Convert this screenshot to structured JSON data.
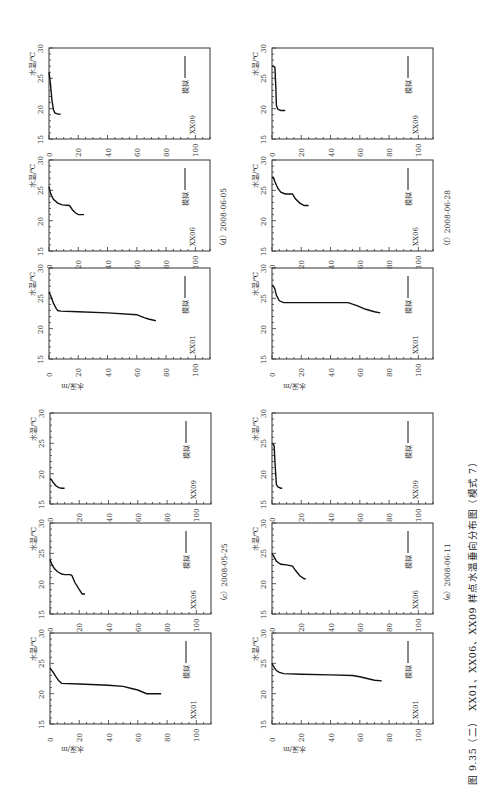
{
  "figure": {
    "caption": "图 9.35（二）　XX01、XX06、XX09 样点水温垂向分布图（模式 7）",
    "orientation": "rotated 90° (landscape figure on portrait page)"
  },
  "labels": {
    "temp_axis": "水温/℃",
    "depth_axis": "水深/m",
    "legend": "模拟 ——"
  },
  "groups": [
    {
      "id": "d",
      "date_label": "（d）2008-06-05"
    },
    {
      "id": "f",
      "date_label": "（f）2008-06-28"
    },
    {
      "id": "c",
      "date_label": "（c）2008-05-25"
    },
    {
      "id": "e",
      "date_label": "（e）2008-06-11"
    }
  ],
  "chart_data": [
    {
      "type": "line",
      "group": "c",
      "date": "2008-05-25",
      "station": "XX01",
      "xlabel": "水深/m",
      "ylabel": "水温/℃",
      "xlim": [
        0,
        110
      ],
      "ylim": [
        15,
        30
      ],
      "xticks": [
        0,
        20,
        40,
        60,
        80,
        100
      ],
      "yticks": [
        15,
        20,
        25,
        30
      ],
      "legend": [
        "模拟"
      ],
      "series": [
        {
          "name": "模拟",
          "depth": [
            0,
            2,
            4,
            6,
            8,
            20,
            40,
            50,
            55,
            60,
            66,
            76
          ],
          "temp": [
            24.2,
            23.6,
            22.8,
            22.1,
            21.7,
            21.6,
            21.4,
            21.2,
            20.9,
            20.6,
            20.0,
            20.0
          ]
        }
      ]
    },
    {
      "type": "line",
      "group": "c",
      "date": "2008-05-25",
      "station": "XX06",
      "xlabel": "水深/m",
      "ylabel": "水温/℃",
      "xlim": [
        0,
        110
      ],
      "ylim": [
        15,
        30
      ],
      "xticks": [
        0,
        20,
        40,
        60,
        80,
        100
      ],
      "yticks": [
        15,
        20,
        25,
        30
      ],
      "legend": [
        "模拟"
      ],
      "series": [
        {
          "name": "模拟",
          "depth": [
            0,
            1,
            3,
            5,
            8,
            10,
            14,
            15,
            17,
            20,
            22,
            24
          ],
          "temp": [
            24.0,
            23.3,
            22.5,
            22.0,
            21.6,
            21.5,
            21.5,
            21.3,
            20.2,
            19.0,
            18.3,
            18.3
          ]
        }
      ]
    },
    {
      "type": "line",
      "group": "c",
      "date": "2008-05-25",
      "station": "XX09",
      "xlabel": "水深/m",
      "ylabel": "水温/℃",
      "xlim": [
        0,
        110
      ],
      "ylim": [
        15,
        30
      ],
      "xticks": [
        0,
        20,
        40,
        60,
        80,
        100
      ],
      "yticks": [
        15,
        20,
        25,
        30
      ],
      "legend": [
        "模拟"
      ],
      "series": [
        {
          "name": "模拟",
          "depth": [
            0,
            1,
            2,
            4,
            6,
            8,
            10
          ],
          "temp": [
            19.2,
            19.0,
            18.6,
            18.0,
            17.7,
            17.6,
            17.6
          ]
        }
      ]
    },
    {
      "type": "line",
      "group": "e",
      "date": "2008-06-11",
      "station": "XX01",
      "xlabel": "水深/m",
      "ylabel": "水温/℃",
      "xlim": [
        0,
        110
      ],
      "ylim": [
        15,
        30
      ],
      "xticks": [
        0,
        20,
        40,
        60,
        80,
        100
      ],
      "yticks": [
        15,
        20,
        25,
        30
      ],
      "legend": [
        "模拟"
      ],
      "series": [
        {
          "name": "模拟",
          "depth": [
            0,
            1,
            3,
            5,
            8,
            20,
            40,
            55,
            60,
            65,
            70,
            75
          ],
          "temp": [
            25.0,
            24.5,
            23.8,
            23.5,
            23.3,
            23.2,
            23.1,
            23.0,
            22.8,
            22.5,
            22.2,
            22.1
          ]
        }
      ]
    },
    {
      "type": "line",
      "group": "e",
      "date": "2008-06-11",
      "station": "XX06",
      "xlabel": "水深/m",
      "ylabel": "水温/℃",
      "xlim": [
        0,
        110
      ],
      "ylim": [
        15,
        30
      ],
      "xticks": [
        0,
        20,
        40,
        60,
        80,
        100
      ],
      "yticks": [
        15,
        20,
        25,
        30
      ],
      "legend": [
        "模拟"
      ],
      "series": [
        {
          "name": "模拟",
          "depth": [
            0,
            1,
            3,
            6,
            10,
            14,
            16,
            19,
            22,
            23
          ],
          "temp": [
            25.0,
            24.6,
            23.7,
            23.2,
            23.1,
            22.9,
            22.2,
            21.3,
            20.8,
            20.8
          ]
        }
      ]
    },
    {
      "type": "line",
      "group": "e",
      "date": "2008-06-11",
      "station": "XX09",
      "xlabel": "水深/m",
      "ylabel": "水温/℃",
      "xlim": [
        0,
        110
      ],
      "ylim": [
        15,
        30
      ],
      "xticks": [
        0,
        20,
        40,
        60,
        80,
        100
      ],
      "yticks": [
        15,
        20,
        25,
        30
      ],
      "legend": [
        "模拟"
      ],
      "series": [
        {
          "name": "模拟",
          "depth": [
            0,
            1,
            1.5,
            2,
            3,
            4,
            6,
            7
          ],
          "temp": [
            25.0,
            24.8,
            24.5,
            22.0,
            18.2,
            17.8,
            17.6,
            17.6
          ]
        }
      ]
    },
    {
      "type": "line",
      "group": "d",
      "date": "2008-06-05",
      "station": "XX01",
      "xlabel": "水深/m",
      "ylabel": "水温/℃",
      "xlim": [
        0,
        110
      ],
      "ylim": [
        15,
        30
      ],
      "xticks": [
        0,
        20,
        40,
        60,
        80,
        100
      ],
      "yticks": [
        15,
        20,
        25,
        30
      ],
      "legend": [
        "模拟"
      ],
      "series": [
        {
          "name": "模拟",
          "depth": [
            0,
            1,
            3,
            5,
            6,
            8,
            20,
            40,
            60,
            62,
            65,
            68,
            73
          ],
          "temp": [
            26.0,
            25.5,
            24.2,
            23.3,
            23.0,
            22.9,
            22.8,
            22.6,
            22.3,
            22.1,
            21.8,
            21.6,
            21.3
          ]
        }
      ]
    },
    {
      "type": "line",
      "group": "d",
      "date": "2008-06-05",
      "station": "XX06",
      "xlabel": "水深/m",
      "ylabel": "水温/℃",
      "xlim": [
        0,
        110
      ],
      "ylim": [
        15,
        30
      ],
      "xticks": [
        0,
        20,
        40,
        60,
        80,
        100
      ],
      "yticks": [
        15,
        20,
        25,
        30
      ],
      "legend": [
        "模拟"
      ],
      "series": [
        {
          "name": "模拟",
          "depth": [
            0,
            1,
            3,
            6,
            9,
            14,
            16,
            18,
            20,
            24
          ],
          "temp": [
            25.6,
            24.5,
            23.5,
            22.9,
            22.6,
            22.5,
            21.8,
            21.3,
            21.0,
            21.0
          ]
        }
      ]
    },
    {
      "type": "line",
      "group": "d",
      "date": "2008-06-05",
      "station": "XX09",
      "xlabel": "水深/m",
      "ylabel": "水温/℃",
      "xlim": [
        0,
        110
      ],
      "ylim": [
        15,
        30
      ],
      "xticks": [
        0,
        20,
        40,
        60,
        80,
        100
      ],
      "yticks": [
        15,
        20,
        25,
        30
      ],
      "legend": [
        "模拟"
      ],
      "series": [
        {
          "name": "模拟",
          "depth": [
            0,
            0.5,
            1,
            2,
            3,
            4,
            6,
            8
          ],
          "temp": [
            26.0,
            25.2,
            24.0,
            21.5,
            19.8,
            19.3,
            19.1,
            19.1
          ]
        }
      ]
    },
    {
      "type": "line",
      "group": "f",
      "date": "2008-06-28",
      "station": "XX01",
      "xlabel": "水深/m",
      "ylabel": "水温/℃",
      "xlim": [
        0,
        110
      ],
      "ylim": [
        15,
        30
      ],
      "xticks": [
        0,
        20,
        40,
        60,
        80,
        100
      ],
      "yticks": [
        15,
        20,
        25,
        30
      ],
      "legend": [
        "模拟"
      ],
      "series": [
        {
          "name": "模拟",
          "depth": [
            0,
            1,
            2,
            3,
            5,
            8,
            20,
            40,
            52,
            58,
            64,
            70,
            74
          ],
          "temp": [
            27.2,
            27.0,
            26.5,
            25.5,
            24.6,
            24.3,
            24.3,
            24.3,
            24.3,
            23.8,
            23.2,
            22.8,
            22.6
          ]
        }
      ]
    },
    {
      "type": "line",
      "group": "f",
      "date": "2008-06-28",
      "station": "XX06",
      "xlabel": "水深/m",
      "ylabel": "水温/℃",
      "xlim": [
        0,
        110
      ],
      "ylim": [
        15,
        30
      ],
      "xticks": [
        0,
        20,
        40,
        60,
        80,
        100
      ],
      "yticks": [
        15,
        20,
        25,
        30
      ],
      "legend": [
        "模拟"
      ],
      "series": [
        {
          "name": "模拟",
          "depth": [
            0,
            1,
            2,
            4,
            6,
            9,
            14,
            16,
            19,
            22,
            25
          ],
          "temp": [
            27.2,
            27.1,
            26.4,
            25.3,
            24.7,
            24.4,
            24.4,
            23.6,
            22.9,
            22.5,
            22.5
          ]
        }
      ]
    },
    {
      "type": "line",
      "group": "f",
      "date": "2008-06-28",
      "station": "XX09",
      "xlabel": "水深/m",
      "ylabel": "水温/℃",
      "xlim": [
        0,
        110
      ],
      "ylim": [
        15,
        30
      ],
      "xticks": [
        0,
        20,
        40,
        60,
        80,
        100
      ],
      "yticks": [
        15,
        20,
        25,
        30
      ],
      "legend": [
        "模拟"
      ],
      "series": [
        {
          "name": "模拟",
          "depth": [
            0,
            1,
            2,
            2.5,
            3,
            4,
            6,
            9
          ],
          "temp": [
            27.0,
            27.0,
            26.8,
            24.0,
            20.5,
            19.9,
            19.7,
            19.7
          ]
        }
      ]
    }
  ]
}
